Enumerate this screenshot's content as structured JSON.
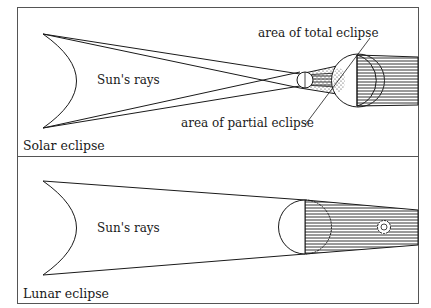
{
  "colors": {
    "ink": "#1a1a1a",
    "frame": "#555555",
    "background": "#ffffff",
    "hatch": "#333333"
  },
  "solar": {
    "panel_label": "Solar eclipse",
    "sun_rays_label": "Sun's rays",
    "total_label": "area of total eclipse",
    "partial_label": "area of partial eclipse"
  },
  "lunar": {
    "panel_label": "Lunar eclipse",
    "sun_rays_label": "Sun's rays"
  }
}
